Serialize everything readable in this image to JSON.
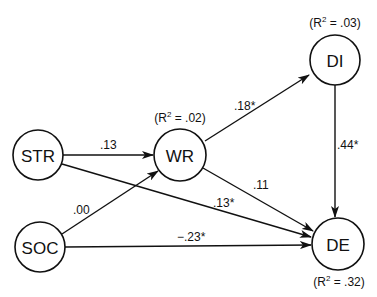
{
  "diagram": {
    "type": "path-model",
    "nodes": [
      {
        "id": "STR",
        "label": "STR",
        "cx": 38,
        "cy": 155,
        "r": 25
      },
      {
        "id": "WR",
        "label": "WR",
        "cx": 180,
        "cy": 155,
        "r": 26
      },
      {
        "id": "DI",
        "label": "DI",
        "cx": 335,
        "cy": 60,
        "r": 25
      },
      {
        "id": "SOC",
        "label": "SOC",
        "cx": 40,
        "cy": 247,
        "r": 25
      },
      {
        "id": "DE",
        "label": "DE",
        "cx": 338,
        "cy": 244,
        "r": 26
      }
    ],
    "r2": {
      "WR": {
        "prefix": "(R",
        "sup": "2",
        "suffix": " = .02)"
      },
      "DI": {
        "prefix": "(R",
        "sup": "2",
        "suffix": " = .03)"
      },
      "DE": {
        "prefix": "(R",
        "sup": "2",
        "suffix": " = .32)"
      }
    },
    "edges": [
      {
        "from": "STR",
        "to": "WR",
        "coef": ".13"
      },
      {
        "from": "SOC",
        "to": "WR",
        "coef": ".00"
      },
      {
        "from": "WR",
        "to": "DI",
        "coef": ".18*"
      },
      {
        "from": "WR",
        "to": "DE",
        "coef": ".11"
      },
      {
        "from": "STR",
        "to": "DE",
        "coef": ".13*"
      },
      {
        "from": "SOC",
        "to": "DE",
        "coef": "−.23*"
      },
      {
        "from": "DI",
        "to": "DE",
        "coef": ".44*"
      }
    ]
  }
}
